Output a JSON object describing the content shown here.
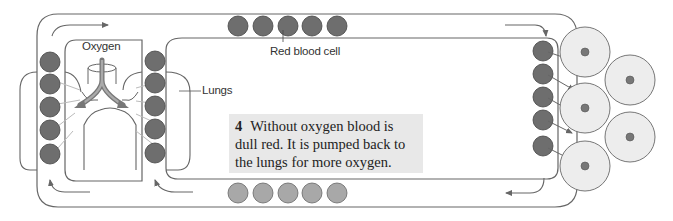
{
  "diagram": {
    "labels": {
      "oxygen": "Oxygen",
      "red_blood_cell": "Red blood cell",
      "lungs": "Lungs"
    },
    "caption": {
      "step_number": "4",
      "text": "Without oxygen blood is dull red. It is pumped back to the lungs for more oxygen.",
      "line1": "Without oxygen blood is",
      "line2": "dull red. It is pumped back to",
      "line3": "the lungs for more oxygen."
    },
    "colors": {
      "oxygenated_cell": "#6e6e6e",
      "deoxygenated_cell": "#a8a8a8",
      "body_cell": "#ededed",
      "body_cell_nucleus": "#777777",
      "caption_background": "#e8e8e8",
      "outline": "#555555"
    },
    "counts": {
      "top_vessel_cells": 5,
      "bottom_vessel_cells": 5,
      "left_lung_cells": 5,
      "right_lung_cells": 5,
      "tissue_side_cells": 5,
      "body_cells": 5
    }
  }
}
